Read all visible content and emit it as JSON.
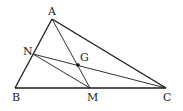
{
  "diagram": {
    "type": "triangle-geometry",
    "points": {
      "A": {
        "label": "A",
        "x": 52,
        "y": 19
      },
      "B": {
        "label": "B",
        "x": 15,
        "y": 88
      },
      "C": {
        "label": "C",
        "x": 166,
        "y": 88
      },
      "M": {
        "label": "M",
        "x": 90,
        "y": 88
      },
      "N": {
        "label": "N",
        "x": 33,
        "y": 54
      },
      "G": {
        "label": "G",
        "x": 78,
        "y": 65
      }
    },
    "segments": [
      [
        "A",
        "B"
      ],
      [
        "B",
        "C"
      ],
      [
        "C",
        "A"
      ],
      [
        "A",
        "M"
      ],
      [
        "N",
        "C"
      ],
      [
        "N",
        "M"
      ]
    ],
    "marked_point": "G",
    "colors": {
      "line": "#1a1a1a",
      "text": "#222222",
      "background": "#ffffff"
    }
  }
}
